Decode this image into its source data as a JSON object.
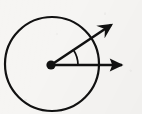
{
  "figure": {
    "title": "Angle formed by two rays from the center of a circle",
    "background_color": "#f6f5f3",
    "ink_color": "#111111",
    "canvas": {
      "width": 142,
      "height": 114
    }
  },
  "chart_data": {
    "type": "diagram",
    "title": "Angle formed by two rays from the center of a circle",
    "xlabel": "",
    "ylabel": "",
    "grid": false,
    "legend": null,
    "coordinate_system": "pixels, origin top-left, y increases downward",
    "elements": [
      {
        "name": "circle",
        "kind": "circle",
        "center_x": 52,
        "center_y": 64,
        "radius": 47,
        "stroke": "#111111",
        "stroke_width": 2.2,
        "fill": "none"
      },
      {
        "name": "vertex-dot",
        "kind": "point",
        "center_x": 51,
        "center_y": 65,
        "radius": 4.6,
        "fill": "#111111"
      },
      {
        "name": "horizontal-ray",
        "kind": "ray",
        "from_x": 51,
        "from_y": 65,
        "to_x": 133,
        "to_y": 65,
        "angle_degrees": 0,
        "length": 82,
        "stroke_width": 2.6,
        "arrowhead": "solid-triangle"
      },
      {
        "name": "diagonal-ray",
        "kind": "ray",
        "from_x": 51,
        "from_y": 65,
        "to_x": 123,
        "to_y": 17,
        "angle_degrees": 33.7,
        "length": 86.5,
        "stroke_width": 2.6,
        "arrowhead": "barbed-open"
      },
      {
        "name": "angle-arc",
        "kind": "arc",
        "center_x": 51,
        "center_y": 65,
        "radius": 27,
        "start_angle_degrees": 0,
        "end_angle_degrees": 33.7,
        "stroke_width": 1.7,
        "fill": "none"
      }
    ],
    "measured_angle_degrees": 33.7,
    "ray_count": 2
  }
}
